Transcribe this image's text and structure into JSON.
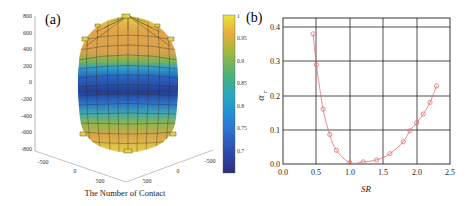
{
  "chart_data": [
    {
      "panel": "(a)",
      "type": "heatmap",
      "subtype": "3d-surface",
      "title": "",
      "xlabel": "The Number of Contact",
      "ylabel": "",
      "z_ticks": [
        "800",
        "600",
        "400",
        "200",
        "0",
        "-200",
        "-400",
        "-600",
        "-800"
      ],
      "z_range": [
        -800,
        800
      ],
      "x_ticks_left": [
        "-500",
        "0",
        "500"
      ],
      "x_ticks_right": [
        "500",
        "0",
        "-500"
      ],
      "colorbar": {
        "ticks": [
          "1",
          "0.95",
          "0.9",
          "0.85",
          "0.8",
          "0.75",
          "0.7"
        ],
        "range": [
          0.68,
          1.0
        ],
        "colormap": "parula"
      },
      "description": "Barrel-shaped 3D surface; top and bottom caps yellow/orange (~0.9-1.0), middle band dark blue (~0.7), with green/light-blue transitions."
    },
    {
      "panel": "(b)",
      "type": "scatter",
      "title": "",
      "xlabel": "SR",
      "ylabel": "α_r",
      "xlim": [
        0.0,
        2.5
      ],
      "ylim": [
        0.0,
        0.4
      ],
      "x_ticks": [
        "0.0",
        "0.5",
        "1.0",
        "1.5",
        "2.0",
        "2.5"
      ],
      "y_ticks": [
        "0.0",
        "0.1",
        "0.2",
        "0.3",
        "0.4"
      ],
      "grid": true,
      "marker": "open-circle",
      "fit_line": true,
      "color": "#e07070",
      "series": [
        {
          "name": "α_r",
          "x": [
            0.45,
            0.5,
            0.6,
            0.7,
            0.8,
            1.0,
            1.2,
            1.4,
            1.6,
            1.8,
            1.9,
            2.0,
            2.1,
            2.2,
            2.3
          ],
          "y": [
            0.38,
            0.29,
            0.16,
            0.086,
            0.04,
            0.004,
            0.006,
            0.012,
            0.03,
            0.065,
            0.097,
            0.12,
            0.146,
            0.18,
            0.228
          ]
        }
      ]
    }
  ],
  "labels": {
    "panel_a": "(a)",
    "panel_b": "(b)",
    "a_xlabel": "The Number of Contact",
    "b_xlabel": "SR",
    "b_ylabel_main": "α",
    "b_ylabel_sub": "r"
  }
}
